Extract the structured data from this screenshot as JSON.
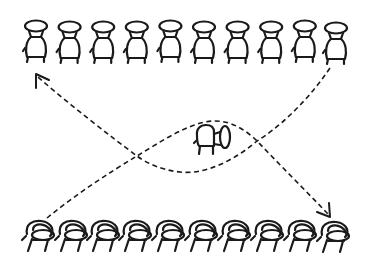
{
  "diagram": {
    "colors": {
      "ink": "#1a1a1a",
      "background": "#ffffff"
    },
    "top_row": {
      "label": "front-facing chairs",
      "count": 10,
      "x_start": 23,
      "spacing": 33.6,
      "y": 20
    },
    "bottom_row": {
      "label": "angled chairs",
      "count": 10,
      "x_start": 22,
      "spacing": 32.4,
      "y": 218
    },
    "center_chair": {
      "label": "single chair (side view)",
      "x": 193,
      "y": 128
    },
    "paths": [
      {
        "name": "top-right-to-top-left",
        "style": "dashed",
        "arrowhead": "top-left",
        "from": [
          330,
          68
        ],
        "to": [
          36,
          74
        ]
      },
      {
        "name": "bottom-left-to-bottom-right",
        "style": "dashed",
        "arrowhead": "bottom-right",
        "from": [
          48,
          218
        ],
        "to": [
          330,
          217
        ]
      }
    ]
  }
}
